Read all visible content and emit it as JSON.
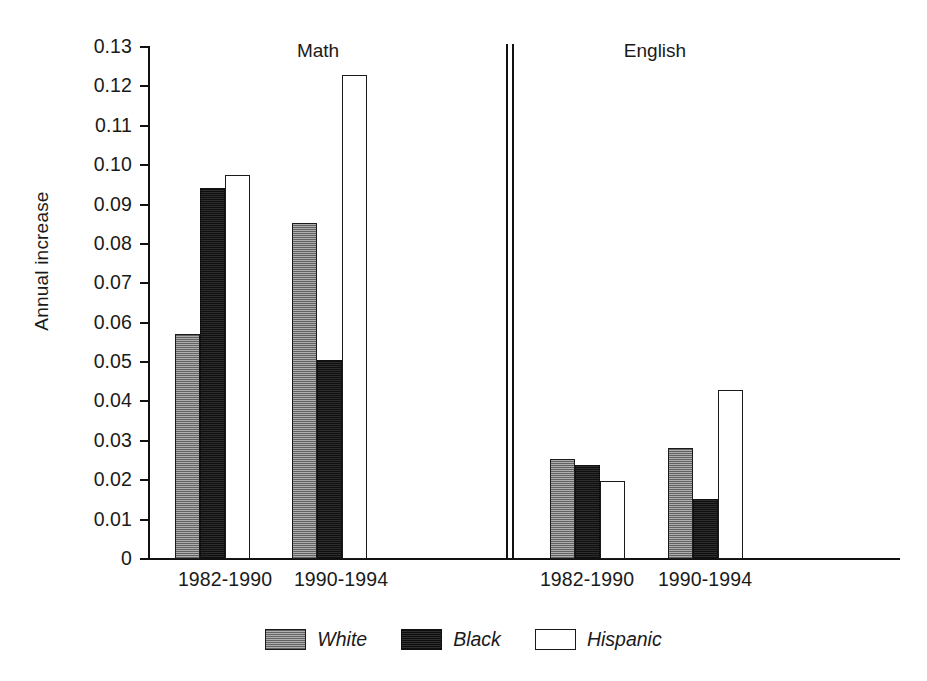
{
  "chart_data": {
    "type": "bar",
    "title": "",
    "xlabel": "",
    "ylabel": "Annual increase",
    "ylim": [
      0,
      0.13
    ],
    "grid": false,
    "legend_position": "bottom-center",
    "panels": [
      {
        "name": "Math",
        "categories": [
          "1982-1990",
          "1990-1994"
        ]
      },
      {
        "name": "English",
        "categories": [
          "1982-1990",
          "1990-1994"
        ]
      }
    ],
    "categories": [
      "Math 1982-1990",
      "Math 1990-1994",
      "English 1982-1990",
      "English 1990-1994"
    ],
    "series": [
      {
        "name": "White",
        "values": [
          0.0572,
          0.0852,
          0.0253,
          0.0282
        ]
      },
      {
        "name": "Black",
        "values": [
          0.0942,
          0.0505,
          0.0238,
          0.0152
        ]
      },
      {
        "name": "Hispanic",
        "values": [
          0.0975,
          0.1228,
          0.0197,
          0.0428
        ]
      }
    ],
    "ytick_labels": [
      "0.13",
      "0.12",
      "0.11",
      "0.10",
      "0.09",
      "0.08",
      "0.07",
      "0.06",
      "0.05",
      "0.04",
      "0.03",
      "0.02",
      "0.01",
      "0"
    ],
    "ytick_values": [
      0.13,
      0.12,
      0.11,
      0.1,
      0.09,
      0.08,
      0.07,
      0.06,
      0.05,
      0.04,
      0.03,
      0.02,
      0.01,
      0
    ]
  },
  "axis": {
    "y_title": "Annual increase",
    "ticks": [
      {
        "label": "0.13",
        "value": 0.13
      },
      {
        "label": "0.12",
        "value": 0.12
      },
      {
        "label": "0.11",
        "value": 0.11
      },
      {
        "label": "0.10",
        "value": 0.1
      },
      {
        "label": "0.09",
        "value": 0.09
      },
      {
        "label": "0.08",
        "value": 0.08
      },
      {
        "label": "0.07",
        "value": 0.07
      },
      {
        "label": "0.06",
        "value": 0.06
      },
      {
        "label": "0.05",
        "value": 0.05
      },
      {
        "label": "0.04",
        "value": 0.04
      },
      {
        "label": "0.03",
        "value": 0.03
      },
      {
        "label": "0.02",
        "value": 0.02
      },
      {
        "label": "0.01",
        "value": 0.01
      },
      {
        "label": "0",
        "value": 0
      }
    ]
  },
  "panels": [
    {
      "title": "Math",
      "x_labels": [
        "1982-1990",
        "1990-1994"
      ]
    },
    {
      "title": "English",
      "x_labels": [
        "1982-1990",
        "1990-1994"
      ]
    }
  ],
  "legend": {
    "items": [
      {
        "label": "White",
        "swatch": "gray-hatched"
      },
      {
        "label": "Black",
        "swatch": "black-filled"
      },
      {
        "label": "Hispanic",
        "swatch": "white-outline"
      }
    ]
  },
  "colors": {
    "white_series": "#8c8c8c",
    "black_series": "#201f1f",
    "hispanic_series": "#ffffff",
    "axis": "#111111"
  }
}
